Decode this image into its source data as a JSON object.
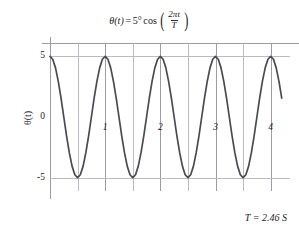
{
  "chart_data": {
    "type": "line",
    "title_parts": {
      "theta_t": "θ(t)",
      "equals": "=",
      "amplitude": "5°",
      "cos": "cos",
      "paren_open": "(",
      "numerator": "2πt",
      "denominator": "T",
      "paren_close": ")"
    },
    "xlabel": "t / T",
    "xlabel_parts": {
      "numerator": "t",
      "denominator": "T"
    },
    "ylabel": "θ(t)",
    "xlim": [
      0,
      4.35
    ],
    "ylim": [
      -6.1,
      6.1
    ],
    "xticks": [
      1,
      2,
      3,
      4
    ],
    "xtick_labels": [
      "1",
      "2",
      "3",
      "4"
    ],
    "yticks": [
      5,
      0,
      -5
    ],
    "ytick_labels": [
      "5",
      "0",
      "-5"
    ],
    "gridlines_x": [
      0,
      0.5,
      1,
      1.5,
      2,
      2.5,
      3,
      3.5,
      4
    ],
    "gridlines_y": [
      5,
      -5
    ],
    "grid": true,
    "legend": "none",
    "amplitude": 5,
    "period_x": 1,
    "phase": "cosine",
    "curve_color": "#4a4a52",
    "grid_color": "#b9bcc4",
    "axis_color": "#9a9da6",
    "x": [
      0,
      0.05,
      0.1,
      0.15,
      0.2,
      0.25,
      0.3,
      0.35,
      0.4,
      0.45,
      0.5,
      0.55,
      0.6,
      0.65,
      0.7,
      0.75,
      0.8,
      0.85,
      0.9,
      0.95,
      1,
      1.05,
      1.1,
      1.15,
      1.2,
      1.25,
      1.3,
      1.35,
      1.4,
      1.45,
      1.5,
      1.55,
      1.6,
      1.65,
      1.7,
      1.75,
      1.8,
      1.85,
      1.9,
      1.95,
      2,
      2.05,
      2.1,
      2.15,
      2.2,
      2.25,
      2.3,
      2.35,
      2.4,
      2.45,
      2.5,
      2.55,
      2.6,
      2.65,
      2.7,
      2.75,
      2.8,
      2.85,
      2.9,
      2.95,
      3,
      3.05,
      3.1,
      3.15,
      3.2,
      3.25,
      3.3,
      3.35,
      3.4,
      3.45,
      3.5,
      3.55,
      3.6,
      3.65,
      3.7,
      3.75,
      3.8,
      3.85,
      3.9,
      3.95,
      4,
      4.05,
      4.1,
      4.15,
      4.2
    ],
    "y": [
      5,
      4.76,
      4.05,
      2.94,
      1.55,
      0,
      -1.55,
      -2.94,
      -4.05,
      -4.76,
      -5,
      -4.76,
      -4.05,
      -2.94,
      -1.55,
      0,
      1.55,
      2.94,
      4.05,
      4.76,
      5,
      4.76,
      4.05,
      2.94,
      1.55,
      0,
      -1.55,
      -2.94,
      -4.05,
      -4.76,
      -5,
      -4.76,
      -4.05,
      -2.94,
      -1.55,
      0,
      1.55,
      2.94,
      4.05,
      4.76,
      5,
      4.76,
      4.05,
      2.94,
      1.55,
      0,
      -1.55,
      -2.94,
      -4.05,
      -4.76,
      -5,
      -4.76,
      -4.05,
      -2.94,
      -1.55,
      0,
      1.55,
      2.94,
      4.05,
      4.76,
      5,
      4.76,
      4.05,
      2.94,
      1.55,
      0,
      -1.55,
      -2.94,
      -4.05,
      -4.76,
      -5,
      -4.76,
      -4.05,
      -2.94,
      -1.55,
      0,
      1.55,
      2.94,
      4.05,
      4.76,
      5,
      4.76,
      4.05,
      2.94,
      1.55
    ],
    "annotations": [
      {
        "text": "T = 2.46 S",
        "position": "bottom-right"
      }
    ]
  },
  "annotation": {
    "period_text": "T = 2.46 S"
  }
}
